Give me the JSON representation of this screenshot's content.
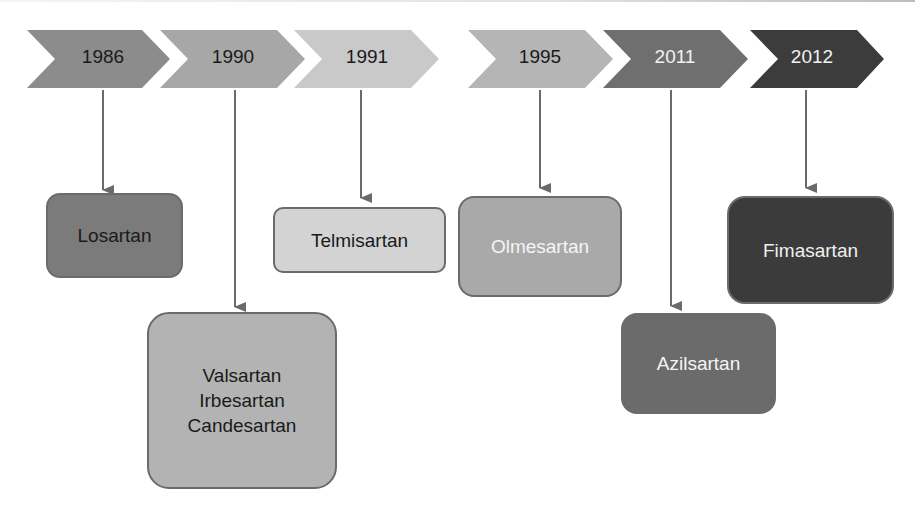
{
  "timeline": [
    {
      "year": "1986",
      "color": "#8c8c8c",
      "text_color": "#1a1a1a"
    },
    {
      "year": "1990",
      "color": "#a7a7a7",
      "text_color": "#1a1a1a"
    },
    {
      "year": "1991",
      "color": "#c9c9c9",
      "text_color": "#1a1a1a"
    },
    {
      "year": "1995",
      "color": "#b5b5b5",
      "text_color": "#1a1a1a"
    },
    {
      "year": "2011",
      "color": "#6f6f6f",
      "text_color": "#f2f2f2"
    },
    {
      "year": "2012",
      "color": "#3c3c3c",
      "text_color": "#f2f2f2"
    }
  ],
  "drugs": [
    {
      "year": "1986",
      "lines": [
        "Losartan"
      ],
      "color": "#7b7b7b",
      "text_color": "#1a1a1a"
    },
    {
      "year": "1990",
      "lines": [
        "Valsartan",
        "Irbesartan",
        "Candesartan"
      ],
      "color": "#b3b3b3",
      "text_color": "#1a1a1a"
    },
    {
      "year": "1991",
      "lines": [
        "Telmisartan"
      ],
      "color": "#d3d3d3",
      "text_color": "#1a1a1a"
    },
    {
      "year": "1995",
      "lines": [
        "Olmesartan"
      ],
      "color": "#a9a9a9",
      "text_color": "#f5f5f5"
    },
    {
      "year": "2011",
      "lines": [
        "Azilsartan"
      ],
      "color": "#6b6b6b",
      "text_color": "#f5f5f5"
    },
    {
      "year": "2012",
      "lines": [
        "Fimasartan"
      ],
      "color": "#3b3b3b",
      "text_color": "#f0f0f0"
    }
  ],
  "arrow_color": "#6a6a6a"
}
